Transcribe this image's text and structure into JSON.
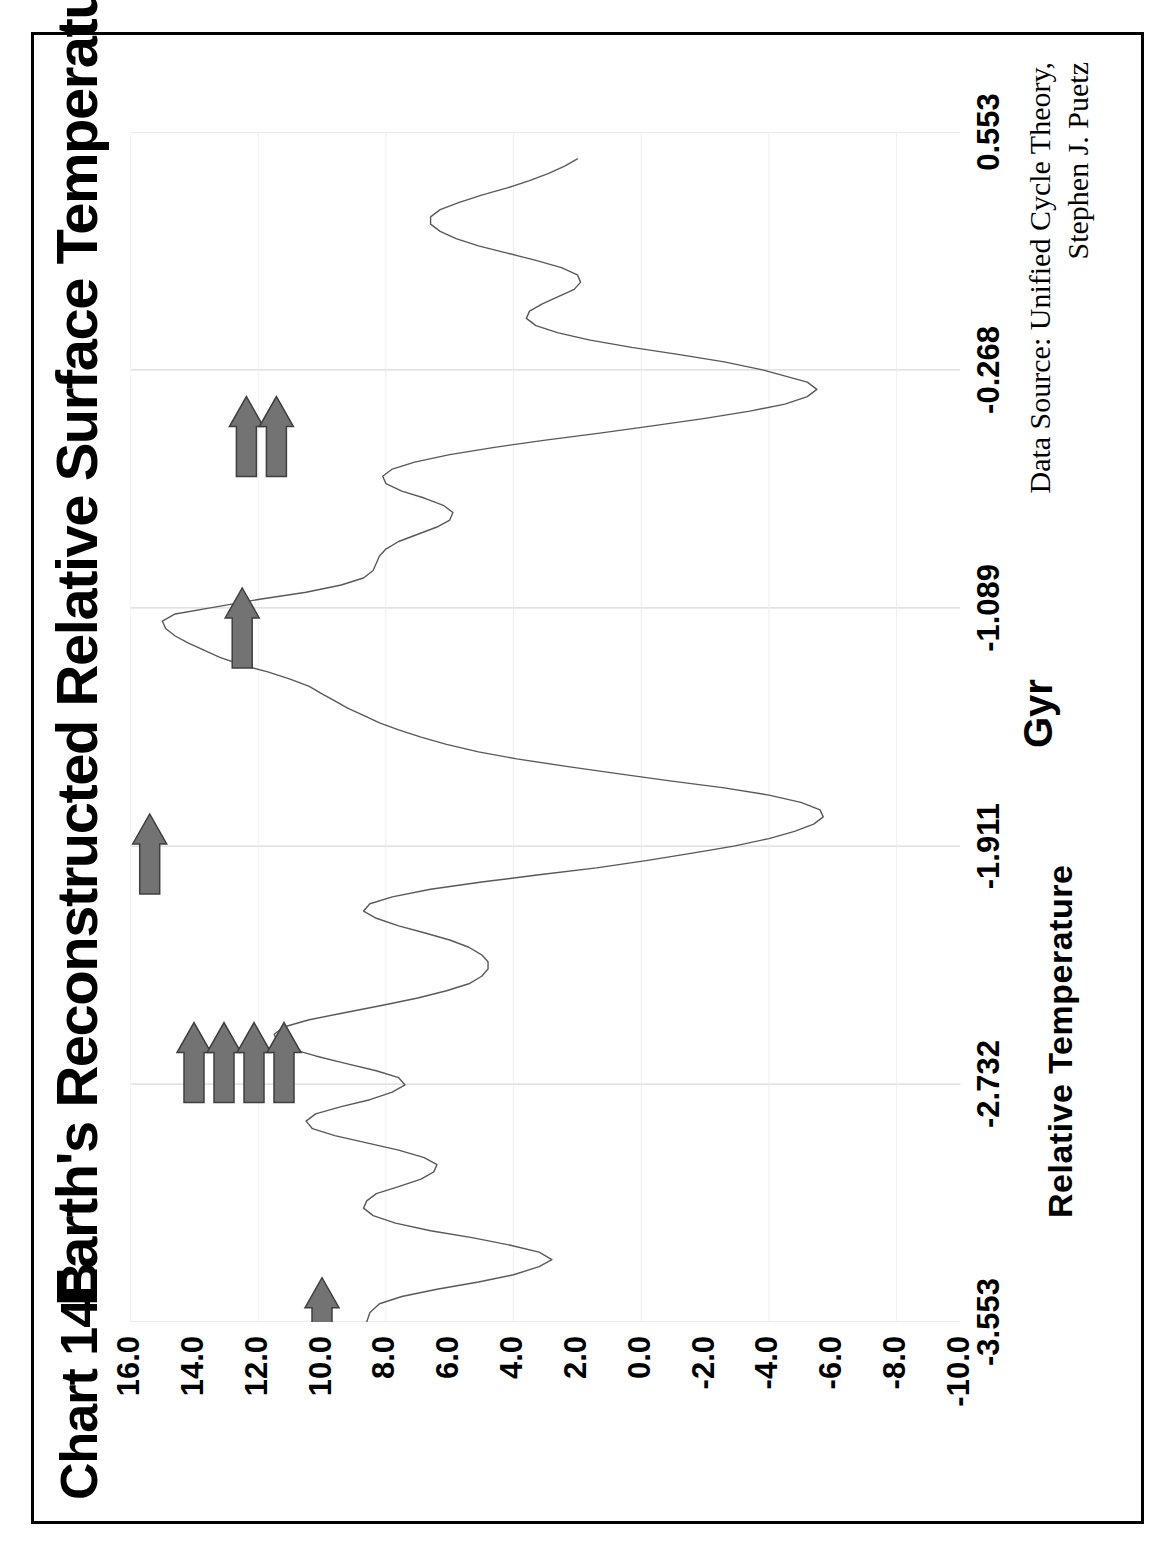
{
  "page": {
    "chart_number": "Chart 14B",
    "title": "Earth's Reconstructed Relative Surface Temperature",
    "source_line1": "Data Source:  Unified Cycle Theory,",
    "source_line2": "Stephen J. Puetz",
    "border_color": "#000000",
    "line_color": "#595959",
    "grid_color": "#d9d9d9",
    "arrow_color": "#737373"
  },
  "chart_data": {
    "type": "line",
    "title": "Earth's Reconstructed Relative Surface Temperature",
    "xlabel": "Gyr",
    "ylabel": "Relative Temperature",
    "xlim": [
      -3.553,
      0.553
    ],
    "ylim": [
      -10.0,
      16.0
    ],
    "grid": true,
    "legend": "none",
    "xticklabels": [
      "-3.553",
      "-2.732",
      "-1.911",
      "-1.089",
      "-0.268",
      "0.553"
    ],
    "xtickvalues": [
      -3.553,
      -2.732,
      -1.911,
      -1.089,
      -0.268,
      0.553
    ],
    "yticklabels": [
      "16.0",
      "14.0",
      "12.0",
      "10.0",
      "8.0",
      "6.0",
      "4.0",
      "2.0",
      "0.0",
      "-2.0",
      "-4.0",
      "-6.0",
      "-8.0",
      "-10.0"
    ],
    "ytickvalues": [
      16,
      14,
      12,
      10,
      8,
      6,
      4,
      2,
      0,
      -2,
      -4,
      -6,
      -8,
      -10
    ],
    "series": [
      {
        "name": "Relative Temperature",
        "x": [
          -3.553,
          -3.52,
          -3.49,
          -3.465,
          -3.44,
          -3.415,
          -3.39,
          -3.362,
          -3.338,
          -3.312,
          -3.288,
          -3.262,
          -3.238,
          -3.212,
          -3.186,
          -3.16,
          -3.135,
          -3.11,
          -3.086,
          -3.06,
          -3.035,
          -3.01,
          -2.986,
          -2.96,
          -2.935,
          -2.91,
          -2.886,
          -2.86,
          -2.835,
          -2.81,
          -2.786,
          -2.76,
          -2.735,
          -2.71,
          -2.686,
          -2.66,
          -2.635,
          -2.61,
          -2.586,
          -2.56,
          -2.535,
          -2.51,
          -2.486,
          -2.46,
          -2.435,
          -2.41,
          -2.386,
          -2.36,
          -2.335,
          -2.31,
          -2.286,
          -2.26,
          -2.235,
          -2.21,
          -2.186,
          -2.16,
          -2.135,
          -2.11,
          -2.086,
          -2.06,
          -2.035,
          -2.01,
          -1.986,
          -1.96,
          -1.935,
          -1.911,
          -1.885,
          -1.86,
          -1.835,
          -1.81,
          -1.786,
          -1.76,
          -1.735,
          -1.71,
          -1.686,
          -1.66,
          -1.635,
          -1.61,
          -1.586,
          -1.56,
          -1.535,
          -1.51,
          -1.486,
          -1.46,
          -1.435,
          -1.41,
          -1.386,
          -1.36,
          -1.335,
          -1.31,
          -1.286,
          -1.26,
          -1.235,
          -1.21,
          -1.186,
          -1.16,
          -1.135,
          -1.11,
          -1.089,
          -1.06,
          -1.035,
          -1.01,
          -0.986,
          -0.96,
          -0.935,
          -0.91,
          -0.886,
          -0.86,
          -0.835,
          -0.81,
          -0.786,
          -0.76,
          -0.735,
          -0.71,
          -0.686,
          -0.66,
          -0.635,
          -0.61,
          -0.586,
          -0.56,
          -0.535,
          -0.51,
          -0.486,
          -0.46,
          -0.435,
          -0.41,
          -0.386,
          -0.36,
          -0.335,
          -0.31,
          -0.286,
          -0.268,
          -0.24,
          -0.215,
          -0.19,
          -0.165,
          -0.14,
          -0.115,
          -0.09,
          -0.065,
          -0.04,
          -0.015,
          0.01,
          0.035,
          0.06,
          0.085,
          0.11,
          0.135,
          0.16,
          0.185,
          0.21,
          0.235,
          0.26,
          0.285,
          0.31,
          0.335,
          0.36,
          0.385,
          0.41,
          0.435,
          0.46
        ],
        "y": [
          8.6,
          8.5,
          8.2,
          7.5,
          6.4,
          5.1,
          4.0,
          3.2,
          2.8,
          3.2,
          4.1,
          5.3,
          6.6,
          7.7,
          8.4,
          8.7,
          8.6,
          8.3,
          7.6,
          6.9,
          6.5,
          6.4,
          6.8,
          7.6,
          8.6,
          9.6,
          10.3,
          10.5,
          10.2,
          9.4,
          8.5,
          7.8,
          7.4,
          7.6,
          8.3,
          9.3,
          10.2,
          11.0,
          11.4,
          11.5,
          11.2,
          10.4,
          9.3,
          8.1,
          7.0,
          6.1,
          5.4,
          5.0,
          4.8,
          4.8,
          5.0,
          5.4,
          6.0,
          6.8,
          7.6,
          8.3,
          8.7,
          8.5,
          7.8,
          6.6,
          5.0,
          3.2,
          1.4,
          -0.2,
          -1.6,
          -2.9,
          -4.0,
          -4.8,
          -5.4,
          -5.7,
          -5.6,
          -5.0,
          -4.0,
          -2.6,
          -0.9,
          0.8,
          2.4,
          3.9,
          5.1,
          6.1,
          6.9,
          7.6,
          8.2,
          8.7,
          9.2,
          9.6,
          10.0,
          10.4,
          11.0,
          11.7,
          12.5,
          13.2,
          13.7,
          14.2,
          14.6,
          14.9,
          15.0,
          14.6,
          13.5,
          12.0,
          10.5,
          9.4,
          8.7,
          8.4,
          8.3,
          8.2,
          8.0,
          7.6,
          7.0,
          6.4,
          6.0,
          5.9,
          6.2,
          6.8,
          7.5,
          8.0,
          8.1,
          7.8,
          7.1,
          6.0,
          4.6,
          3.0,
          1.3,
          -0.4,
          -2.0,
          -3.4,
          -4.5,
          -5.2,
          -5.5,
          -5.2,
          -4.4,
          -3.8,
          -2.6,
          -1.2,
          0.3,
          1.6,
          2.6,
          3.3,
          3.6,
          3.5,
          3.1,
          2.6,
          2.1,
          1.9,
          2.0,
          2.5,
          3.3,
          4.2,
          5.1,
          5.8,
          6.3,
          6.6,
          6.6,
          6.3,
          5.7,
          5.0,
          4.2,
          3.5,
          2.9,
          2.4,
          2.0
        ]
      }
    ],
    "annotations": [
      {
        "name": "event-arrow-1",
        "label": "arrow",
        "x": -3.4,
        "y": 10.0,
        "count": 1
      },
      {
        "name": "event-arrow-group-4",
        "label": "arrow-cluster",
        "x": -2.52,
        "y": 12.6,
        "count": 4
      },
      {
        "name": "event-arrow-2",
        "label": "arrow",
        "x": -1.8,
        "y": 15.4,
        "count": 1
      },
      {
        "name": "event-arrow-3",
        "label": "arrow",
        "x": -1.02,
        "y": 12.5,
        "count": 1
      },
      {
        "name": "event-arrow-group-2",
        "label": "arrow-cluster",
        "x": -0.36,
        "y": 11.9,
        "count": 2
      }
    ]
  }
}
